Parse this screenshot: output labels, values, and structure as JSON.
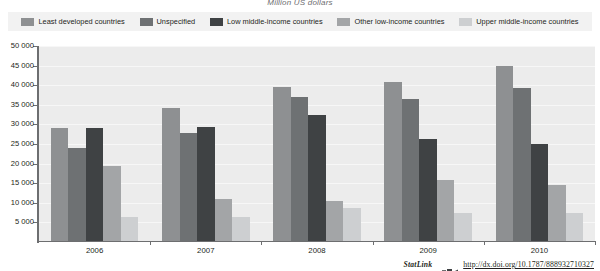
{
  "chart_data": {
    "type": "bar",
    "title": "Million US dollars",
    "xlabel": "",
    "ylabel": "",
    "categories": [
      "2006",
      "2007",
      "2008",
      "2009",
      "2010"
    ],
    "ylim": [
      0,
      50000
    ],
    "yticks": [
      0,
      5000,
      10000,
      15000,
      20000,
      25000,
      30000,
      35000,
      40000,
      45000,
      50000
    ],
    "ytick_labels": [
      "0",
      "5 000",
      "10 000",
      "15 000",
      "20 000",
      "25 000",
      "30 000",
      "35 000",
      "40 000",
      "45 000",
      "50 000"
    ],
    "grid": true,
    "legend_position": "top",
    "series": [
      {
        "name": "Least developed countries",
        "color": "#8e9092",
        "values": [
          29000,
          34100,
          39500,
          40700,
          44800
        ]
      },
      {
        "name": "Unspecified",
        "color": "#6e7173",
        "values": [
          24100,
          27900,
          37000,
          36500,
          39300
        ]
      },
      {
        "name": "Low middle-income countries",
        "color": "#3f4244",
        "values": [
          29000,
          29400,
          32500,
          26400,
          25000
        ]
      },
      {
        "name": "Other low-income countries",
        "color": "#a3a5a7",
        "values": [
          19300,
          11000,
          10500,
          15800,
          14500
        ]
      },
      {
        "name": "Upper middle-income countries",
        "color": "#cdcfd1",
        "values": [
          6500,
          6500,
          8700,
          7500,
          7400
        ]
      }
    ]
  },
  "footer": {
    "statlink_label": "StatLink",
    "logo_name": "statlink-logo-icon",
    "url": "http://dx.doi.org/10.1787/888932710327"
  },
  "colors": {
    "plot_background": "#ececec",
    "legend_background": "#f2f2f2",
    "axis": "#6d6e70",
    "gridline": "#f7f7f7",
    "text": "#231f20"
  }
}
